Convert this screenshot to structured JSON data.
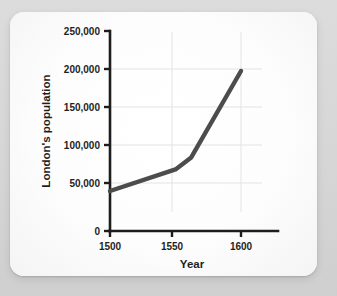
{
  "chart_data": {
    "type": "line",
    "title": "",
    "xlabel": "Year",
    "ylabel": "London's population",
    "x": [
      1500,
      1550,
      1562,
      1600
    ],
    "values": [
      50000,
      77000,
      92000,
      200000
    ],
    "series": [
      {
        "name": "London's population",
        "x": [
          1500,
          1550,
          1562,
          1600
        ],
        "values": [
          50000,
          77000,
          92000,
          200000
        ],
        "color": "#4c4c4c"
      }
    ],
    "xlim": [
      1500,
      1620
    ],
    "ylim": [
      0,
      250000
    ],
    "xticks": [
      1500,
      1550,
      1600
    ],
    "xtick_labels": [
      "1500",
      "1550",
      "1600"
    ],
    "yticks": [
      0,
      50000,
      100000,
      150000,
      200000,
      250000
    ],
    "ytick_labels": [
      "0",
      "50,000",
      "100,000",
      "150,000",
      "200,000",
      "250,000"
    ],
    "grid": true,
    "gridlines_x": [
      1550,
      1600
    ],
    "gridlines_y": [
      100000,
      150000,
      200000
    ],
    "legend": null,
    "legend_position": "none",
    "annotations": []
  },
  "axes": {
    "y_title": "London's population",
    "x_title": "Year",
    "y_tick_0": "0",
    "y_tick_1": "50,000",
    "y_tick_2": "100,000",
    "y_tick_3": "150,000",
    "y_tick_4": "200,000",
    "y_tick_5": "250,000",
    "x_tick_0": "1500",
    "x_tick_1": "1550",
    "x_tick_2": "1600"
  },
  "style": {
    "page_background": "#d9d9d9",
    "card_background": "#fdfdfd",
    "line_color": "#4c4c4c",
    "axis_color": "#1d1d1d",
    "grid_color": "#e3e3e3",
    "text_color": "#1f1f1f"
  }
}
